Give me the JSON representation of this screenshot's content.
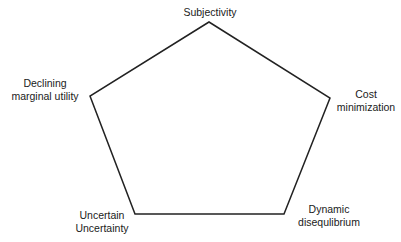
{
  "diagram": {
    "type": "pentagon",
    "stroke_color": "#222222",
    "background_color": "#ffffff",
    "vertices": {
      "top": {
        "x": 209,
        "y": 22
      },
      "left": {
        "x": 90,
        "y": 96
      },
      "right": {
        "x": 330,
        "y": 98
      },
      "bottom_left": {
        "x": 135,
        "y": 214
      },
      "bottom_right": {
        "x": 284,
        "y": 214
      }
    },
    "labels": {
      "top": {
        "lines": [
          "Subjectivity"
        ]
      },
      "left": {
        "lines": [
          "Declining",
          "marginal utility"
        ]
      },
      "right": {
        "lines": [
          "Cost",
          "minimization"
        ]
      },
      "bottom_left": {
        "lines": [
          "Uncertain",
          "Uncertainty"
        ]
      },
      "bottom_right": {
        "lines": [
          "Dynamic",
          "disequlibrium"
        ]
      }
    }
  }
}
